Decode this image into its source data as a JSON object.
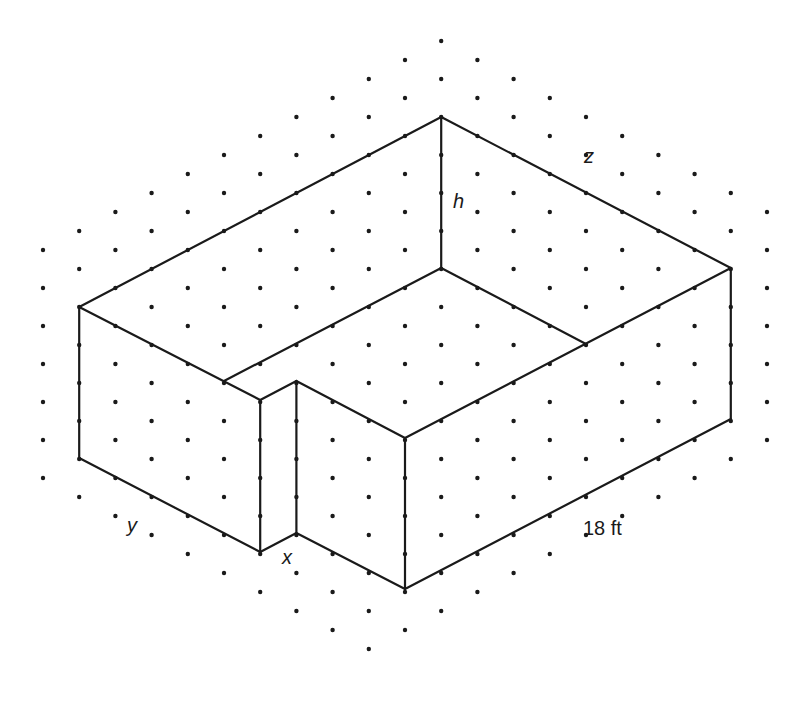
{
  "figure": {
    "type": "isometric dot-grid drawing of an L-shaped (notched) open box / room",
    "colors": {
      "ink": "#1a1a1a",
      "background": "#ffffff"
    }
  },
  "grid": {
    "origin_x": 43,
    "col_spacing": 36.2,
    "row_step": 38,
    "columns": 21,
    "dot_radius": 2.2,
    "description": "Hexagonal region of isometric dots",
    "y_min_rule": "c<=11: 250-19c; c>11: 41+19(c-11)",
    "y_max_rule": "c<=9: 514+19c; c>9: 685-19(c-9)"
  },
  "vertices": {
    "A_top_back": [
      11,
      117
    ],
    "B_left": [
      1,
      307
    ],
    "C_right": [
      19,
      268
    ],
    "D_inner_back": [
      11,
      268
    ],
    "E_inner_left": [
      5,
      381
    ],
    "F_inner_right": [
      15,
      344
    ],
    "G_notch_left_top": [
      6,
      400
    ],
    "H_notch_right_top": [
      7,
      381
    ],
    "I_front_top": [
      10,
      438
    ],
    "J_left_bottom": [
      1,
      458
    ],
    "K_notch_left_bottom": [
      6,
      552
    ],
    "L_notch_right_bottom": [
      7,
      533
    ],
    "M_front_bottom": [
      10,
      589
    ],
    "N_right_bottom": [
      19,
      419
    ]
  },
  "edges": [
    [
      "A_top_back",
      "B_left"
    ],
    [
      "A_top_back",
      "C_right"
    ],
    [
      "A_top_back",
      "D_inner_back"
    ],
    [
      "B_left",
      "G_notch_left_top"
    ],
    [
      "B_left",
      "J_left_bottom"
    ],
    [
      "E_inner_left",
      "D_inner_back"
    ],
    [
      "D_inner_back",
      "F_inner_right"
    ],
    [
      "C_right",
      "I_front_top"
    ],
    [
      "C_right",
      "N_right_bottom"
    ],
    [
      "N_right_bottom",
      "M_front_bottom"
    ],
    [
      "I_front_top",
      "M_front_bottom"
    ],
    [
      "J_left_bottom",
      "K_notch_left_bottom"
    ],
    [
      "K_notch_left_bottom",
      "L_notch_right_bottom"
    ],
    [
      "L_notch_right_bottom",
      "M_front_bottom"
    ],
    [
      "G_notch_left_top",
      "K_notch_left_bottom"
    ],
    [
      "H_notch_right_top",
      "L_notch_right_bottom"
    ],
    [
      "G_notch_left_top",
      "H_notch_right_top"
    ],
    [
      "H_notch_right_top",
      "I_front_top"
    ]
  ],
  "labels": {
    "h": {
      "text": "h",
      "x": 453,
      "y": 191,
      "italic": true
    },
    "z": {
      "text": "z",
      "x": 584,
      "y": 146,
      "italic": true
    },
    "y": {
      "text": "y",
      "x": 127,
      "y": 515,
      "italic": true
    },
    "x": {
      "text": "x",
      "x": 282,
      "y": 547,
      "italic": true
    },
    "length": {
      "text": "18 ft",
      "x": 583,
      "y": 518,
      "italic": false
    }
  }
}
